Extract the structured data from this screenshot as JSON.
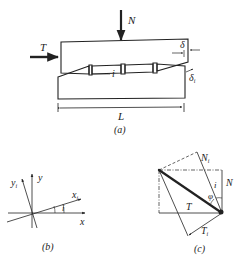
{
  "figure_a": {
    "caption": "(a)",
    "labels": {
      "normal_force": "N",
      "shear_force": "T",
      "displacement": "δ",
      "displacement_i": "δ",
      "displacement_i_sub": "i",
      "angle": "i",
      "length": "L"
    }
  },
  "figure_b": {
    "caption": "(b)",
    "labels": {
      "x": "x",
      "y": "y",
      "xi": "x",
      "xi_sub": "i",
      "yi": "y",
      "yi_sub": "i",
      "angle": "i"
    }
  },
  "figure_c": {
    "caption": "(c)",
    "labels": {
      "normal": "N",
      "normal_i": "N",
      "normal_i_sub": "i",
      "shear": "T",
      "shear_i": "T",
      "shear_i_sub": "i",
      "angle_i": "i",
      "angle_phi": "φ"
    }
  },
  "colors": {
    "ink": "#222222",
    "background": "#ffffff"
  }
}
